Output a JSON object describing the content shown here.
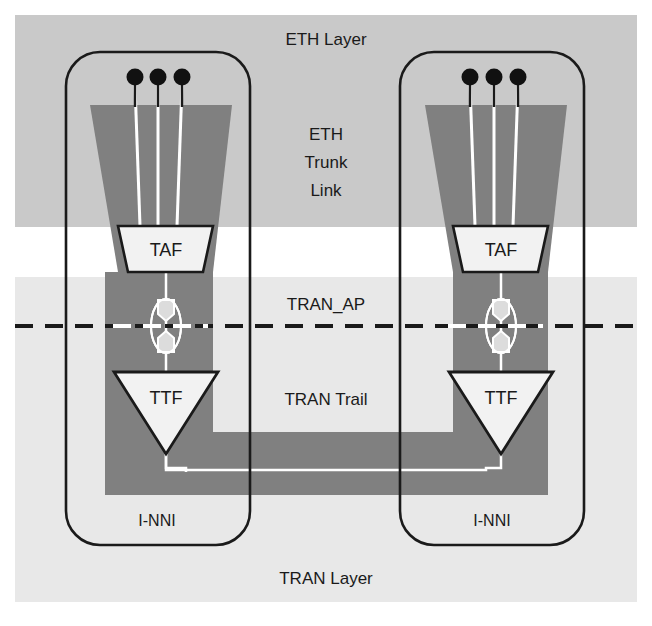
{
  "figure": {
    "width": 652,
    "height": 626,
    "background": "#ffffff"
  },
  "colors": {
    "eth_layer_band": "#c9c9c9",
    "tran_layer_band": "#e8e8e8",
    "trunk_fill": "#808080",
    "trail_fill": "#808080",
    "node_fill": "#f2f2f2",
    "outline": "#1a1a1a",
    "white_trace": "#ffffff",
    "page": "#ffffff"
  },
  "bands": [
    {
      "id": "eth-layer-band",
      "label": "ETH Layer",
      "fill": "#c9c9c9",
      "x": 15,
      "y": 15,
      "width": 622,
      "height": 212
    },
    {
      "id": "tran-layer-band",
      "label": "TRAN Layer",
      "fill": "#e8e8e8",
      "x": 15,
      "y": 277,
      "width": 622,
      "height": 325
    }
  ],
  "labels": {
    "eth_layer": "ETH Layer",
    "eth_trunk_link": [
      "ETH",
      "Trunk",
      "Link"
    ],
    "tran_ap": "TRAN_AP",
    "tran_trail": "TRAN Trail",
    "tran_layer": "TRAN Layer",
    "inni_left": "I-NNI",
    "inni_right": "I-NNI",
    "taf_left": "TAF",
    "taf_right": "TAF",
    "ttf_left": "TTF",
    "ttf_right": "TTF"
  },
  "nodes": [
    {
      "id": "left-node",
      "name": "left-network-element",
      "inni_label": "I-NNI",
      "box": {
        "x": 66,
        "y": 52,
        "width": 184,
        "height": 493,
        "radius": 34
      },
      "termination_points": [
        {
          "id": "eth-tp-1",
          "cx": 135,
          "cy": 77,
          "r": 8
        },
        {
          "id": "eth-tp-2",
          "cx": 158,
          "cy": 77,
          "r": 8
        },
        {
          "id": "eth-tp-3",
          "cx": 182,
          "cy": 77,
          "r": 8
        }
      ],
      "taf": {
        "label": "TAF",
        "x": 118,
        "y": 226,
        "width": 95,
        "height": 46
      },
      "ttf": {
        "label": "TTF",
        "cx": 166,
        "y": 372,
        "width": 104,
        "height": 82
      },
      "tran_ap": {
        "cx": 166,
        "cy": 326
      }
    },
    {
      "id": "right-node",
      "name": "right-network-element",
      "inni_label": "I-NNI",
      "box": {
        "x": 400,
        "y": 52,
        "width": 184,
        "height": 493,
        "radius": 34
      },
      "termination_points": [
        {
          "id": "eth-tp-1",
          "cx": 470,
          "cy": 77,
          "r": 8
        },
        {
          "id": "eth-tp-2",
          "cx": 494,
          "cy": 77,
          "r": 8
        },
        {
          "id": "eth-tp-3",
          "cx": 518,
          "cy": 77,
          "r": 8
        }
      ],
      "taf": {
        "label": "TAF",
        "x": 453,
        "y": 226,
        "width": 95,
        "height": 46
      },
      "ttf": {
        "label": "TTF",
        "cx": 501,
        "y": 372,
        "width": 104,
        "height": 82
      },
      "tran_ap": {
        "cx": 501,
        "cy": 326
      }
    }
  ],
  "trunk_links": [
    {
      "id": "left-trunk",
      "top_left": 90,
      "top_right": 232,
      "top_y": 105,
      "bottom_left": 118,
      "bottom_right": 213,
      "bottom_y": 226
    },
    {
      "id": "right-trunk",
      "top_left": 425,
      "top_right": 567,
      "top_y": 105,
      "bottom_left": 453,
      "bottom_right": 548,
      "bottom_y": 226
    }
  ],
  "tran_trail": {
    "id": "tran-trail-path",
    "label": "TRAN Trail",
    "outer": {
      "left": 105,
      "right": 548,
      "top": 272,
      "bottom": 495
    },
    "inner_gap": {
      "left": 213,
      "right": 453,
      "top": 272,
      "bottom": 432
    }
  },
  "ap_dashed_line": {
    "id": "tran-ap-reference-line",
    "y": 326,
    "x1": 15,
    "x2": 637,
    "dash": "18 12"
  }
}
